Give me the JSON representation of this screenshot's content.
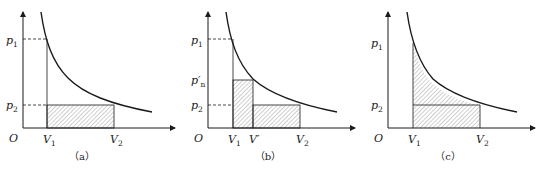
{
  "figure": {
    "panels": [
      {
        "id": "a",
        "caption": "（a）",
        "origin_label": "O",
        "y_labels": {
          "p1": "p",
          "p1_sub": "1",
          "p2": "p",
          "p2_sub": "2"
        },
        "x_labels": {
          "V1": "V",
          "V1_sub": "1",
          "V2": "V",
          "V2_sub": "2"
        },
        "shading": "rectangle from V1 to V2 under p2"
      },
      {
        "id": "b",
        "caption": "（b）",
        "origin_label": "O",
        "y_labels": {
          "p1": "p",
          "p1_sub": "1",
          "pn": "p′",
          "pn_sub": "n",
          "p2": "p",
          "p2_sub": "2"
        },
        "x_labels": {
          "V1": "V",
          "V1_sub": "1",
          "Vp": "V′",
          "V2": "V",
          "V2_sub": "2"
        },
        "shading": "step rectangles: V1–V′ under p′n, V′–V2 under p2"
      },
      {
        "id": "c",
        "caption": "（c）",
        "origin_label": "O",
        "y_labels": {
          "p1": "p",
          "p1_sub": "1",
          "p2": "p",
          "p2_sub": "2"
        },
        "x_labels": {
          "V1": "V",
          "V1_sub": "1",
          "V2": "V",
          "V2_sub": "2"
        },
        "shading": "area under curve from V1 to V2"
      }
    ],
    "colors": {
      "line": "#1a1a1a",
      "hatch": "#777777",
      "text": "#222222"
    }
  }
}
